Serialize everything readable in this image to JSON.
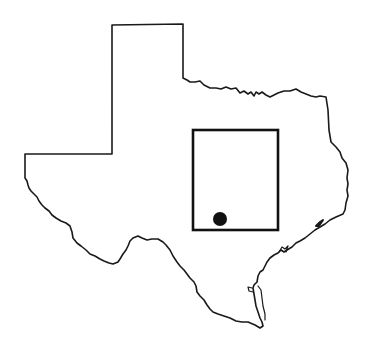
{
  "map": {
    "subject": "Texas state outline",
    "outline_color": "#1a1a1a",
    "background": "#ffffff",
    "highlight_region": {
      "shape": "rectangle",
      "x": 193,
      "y": 130,
      "width": 85,
      "height": 100,
      "color": "#111111"
    },
    "marker": {
      "shape": "filled-circle",
      "cx": 220,
      "cy": 219,
      "r": 7,
      "color": "#111111"
    }
  }
}
